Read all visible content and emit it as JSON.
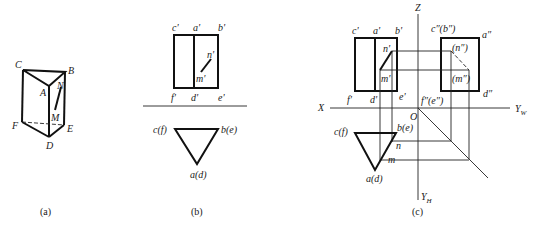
{
  "figures": {
    "a": {
      "caption": "(a)",
      "labels": {
        "C": "C",
        "B": "B",
        "A": "A",
        "N": "N",
        "M": "M",
        "F": "F",
        "E": "E",
        "D": "D"
      }
    },
    "b": {
      "caption": "(b)",
      "labels": {
        "c_prime": "c'",
        "a_prime": "a'",
        "b_prime": "b'",
        "n_prime": "n'",
        "m_prime": "m'",
        "f_prime": "f'",
        "d_prime": "d'",
        "e_prime": "e'",
        "cf": "c(f)",
        "be": "b(e)",
        "ad": "a(d)"
      }
    },
    "c": {
      "caption": "(c)",
      "labels": {
        "Z": "Z",
        "X": "X",
        "O": "O",
        "YW": "Y",
        "YW_sub": "W",
        "YH": "Y",
        "YH_sub": "H",
        "c_prime": "c'",
        "a_prime": "a'",
        "b_prime": "b'",
        "n_prime": "n'",
        "m_prime": "m'",
        "f_prime": "f'",
        "d_prime": "d'",
        "e_prime": "e'",
        "c2b2": "c″(b″)",
        "a2": "a″",
        "n2": "(n″)",
        "m2": "(m″)",
        "d2": "d″",
        "f2e2": "f″(e″)",
        "cf": "c(f)",
        "be": "b(e)",
        "ad": "a(d)",
        "n": "n",
        "m": "m"
      }
    }
  }
}
